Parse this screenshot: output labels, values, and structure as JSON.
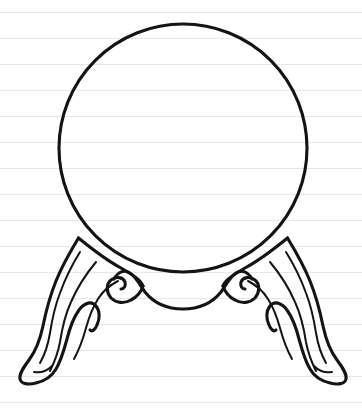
{
  "page": {
    "width": 362,
    "height": 415,
    "background_color": "#ffffff",
    "medium": "ruled notebook paper"
  },
  "paper": {
    "name": "ruled-notebook-paper",
    "line_color": "#e7e7ea",
    "line_spacing": 26,
    "first_line_y": 12,
    "line_count": 16,
    "lines_y": [
      12,
      38,
      64,
      90,
      116,
      142,
      168,
      194,
      220,
      246,
      272,
      298,
      324,
      350,
      376,
      402
    ]
  },
  "drawing": {
    "name": "ball-on-stand",
    "stroke_color": "#141414",
    "description": "Outline drawing of a large sphere resting on a two-legged ornate stand with scrolled cabriole feet",
    "elements": [
      {
        "name": "sphere",
        "label": "Ball",
        "shape": "circle",
        "center_x": 183,
        "center_y": 148,
        "radius": 124,
        "stroke_width": 3.1
      },
      {
        "name": "stand-apron",
        "label": "Apron",
        "shape": "curve",
        "stroke_width": 3.1
      },
      {
        "name": "left-leg",
        "label": "Left cabriole leg",
        "shape": "outline",
        "stroke_width": 3.1,
        "contour_lines": 3,
        "has_volute": true
      },
      {
        "name": "right-leg",
        "label": "Right cabriole leg",
        "shape": "outline",
        "stroke_width": 3.1,
        "contour_lines": 3,
        "has_volute": true
      },
      {
        "name": "left-foot",
        "label": "Left scrolled foot",
        "shape": "outline",
        "stroke_width": 3.1
      },
      {
        "name": "right-foot",
        "label": "Right scrolled foot",
        "shape": "outline",
        "stroke_width": 3.1
      }
    ]
  }
}
